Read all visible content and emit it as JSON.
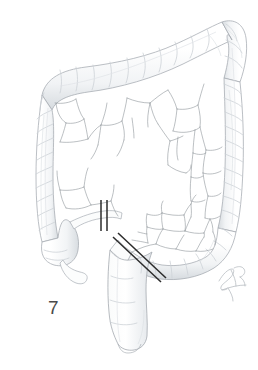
{
  "figure": {
    "number_label": "7",
    "caption_visible": false,
    "background_color": "#ffffff",
    "artist_signature_text": "",
    "artist_signature_present": true
  },
  "style": {
    "outline_color": "#9aa0a6",
    "outline_light_color": "#c9ced3",
    "haustra_shade_color": "#d9dee2",
    "appendage_line_color": "#8a9097",
    "marker_line_color": "#2b2b2b",
    "label_color": "#4a4a4a",
    "signature_color": "#b9bec3"
  },
  "structures": [
    {
      "name": "transverse-colon",
      "label": "Transverse colon",
      "region": "top"
    },
    {
      "name": "hepatic-flexure",
      "label": "Hepatic flexure",
      "region": "top-left"
    },
    {
      "name": "splenic-flexure",
      "label": "Splenic flexure",
      "region": "top-right"
    },
    {
      "name": "ascending-colon",
      "label": "Ascending colon",
      "region": "left"
    },
    {
      "name": "descending-colon",
      "label": "Descending colon",
      "region": "right"
    },
    {
      "name": "cecum",
      "label": "Cecum",
      "region": "lower-left"
    },
    {
      "name": "vermiform-appendix",
      "label": "Vermiform appendix",
      "region": "lower-left"
    },
    {
      "name": "terminal-ileum",
      "label": "Terminal ileum",
      "region": "center-left"
    },
    {
      "name": "sigmoid-colon",
      "label": "Sigmoid colon",
      "region": "lower-right"
    },
    {
      "name": "rectum",
      "label": "Rectum",
      "region": "bottom-center"
    },
    {
      "name": "epiploic-appendages",
      "label": "Epiploic appendages",
      "region": "interior"
    }
  ],
  "resection_markers": [
    {
      "name": "proximal-resection-marker",
      "orientation": "vertical",
      "pair_count": 2,
      "x1": 101,
      "y1": 200,
      "x2": 101,
      "y2": 231,
      "x1b": 107,
      "y1b": 200,
      "x2b": 107,
      "y2b": 231
    },
    {
      "name": "distal-resection-marker",
      "orientation": "diagonal",
      "pair_count": 2,
      "x1": 113,
      "y1": 237,
      "x2": 161,
      "y2": 282,
      "x1b": 118,
      "y1b": 233,
      "x2b": 166,
      "y2b": 278
    }
  ]
}
